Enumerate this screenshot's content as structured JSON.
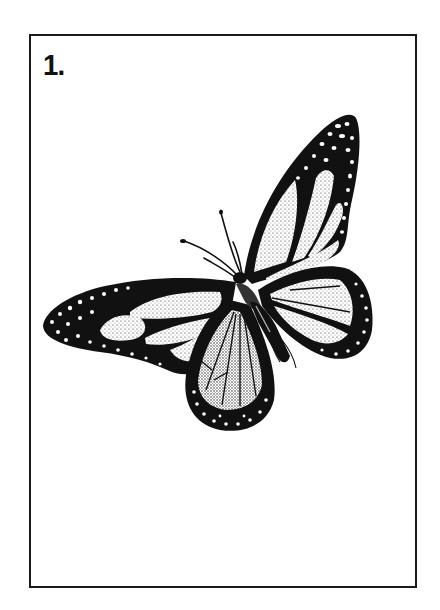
{
  "card": {
    "number_label": "1.",
    "illustration": {
      "subject": "butterfly-icon",
      "style": "stipple ink drawing, black on white"
    }
  },
  "colors": {
    "ink": "#111111",
    "paper": "#ffffff",
    "frame": "#1a1a1a"
  }
}
